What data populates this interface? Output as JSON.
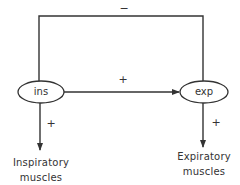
{
  "diagram": {
    "nodes": [
      {
        "id": "ins",
        "label": "ins"
      },
      {
        "id": "exp",
        "label": "exp"
      }
    ],
    "edges": [
      {
        "from": "ins",
        "to": "exp",
        "sign": "+"
      },
      {
        "from": "exp",
        "to": "ins",
        "sign": "−",
        "route": "top-feedback-loop"
      },
      {
        "from": "ins",
        "to": "inspiratory_muscles",
        "sign": "+"
      },
      {
        "from": "exp",
        "to": "expiratory_muscles",
        "sign": "+"
      }
    ],
    "signs": {
      "feedback": "−",
      "ins_to_exp": "+",
      "ins_to_muscles": "+",
      "exp_to_muscles": "+"
    },
    "outputs": {
      "inspiratory": {
        "line1": "Inspiratory",
        "line2": "muscles"
      },
      "expiratory": {
        "line1": "Expiratory",
        "line2": "muscles"
      }
    },
    "colors": {
      "line": "#333333",
      "background": "#ffffff"
    }
  }
}
